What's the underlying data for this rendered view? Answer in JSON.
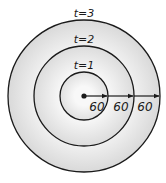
{
  "diagram": {
    "center": {
      "x": 84,
      "y": 96
    },
    "circles": [
      {
        "label": "t=1",
        "radius": 24,
        "fill": "#f2f2f2"
      },
      {
        "label": "t=2",
        "radius": 50,
        "fill": "#e9e9e9"
      },
      {
        "label": "t=3",
        "radius": 76,
        "fill": "#e4e4e4"
      }
    ],
    "segments": [
      {
        "label": "60"
      },
      {
        "label": "60"
      },
      {
        "label": "60"
      }
    ],
    "colors": {
      "stroke": "#1a1a1a",
      "background": "#ffffff"
    }
  }
}
